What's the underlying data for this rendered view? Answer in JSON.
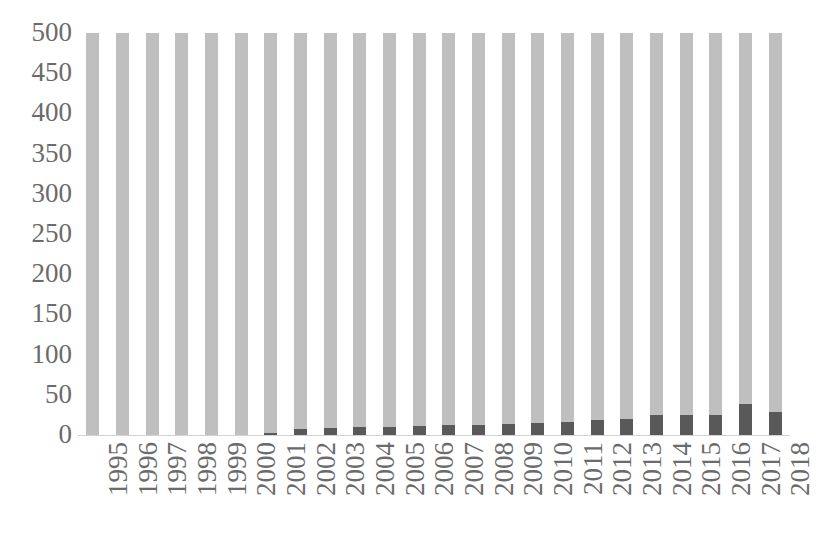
{
  "chart_data": {
    "type": "bar",
    "title": "",
    "subtitle": "",
    "xlabel": "",
    "ylabel": "",
    "ylim": [
      0,
      500
    ],
    "ytick_labels": [
      "500",
      "450",
      "400",
      "350",
      "300",
      "250",
      "200",
      "150",
      "100",
      "50",
      "0"
    ],
    "ytick_values": [
      500,
      450,
      400,
      350,
      300,
      250,
      200,
      150,
      100,
      50,
      0
    ],
    "grid": false,
    "legend": "none",
    "bar_overlap": "overlaid",
    "categories": [
      "1995",
      "1996",
      "1997",
      "1998",
      "1999",
      "2000",
      "2001",
      "2002",
      "2003",
      "2004",
      "2005",
      "2006",
      "2007",
      "2008",
      "2009",
      "2010",
      "2011",
      "2012",
      "2013",
      "2014",
      "2015",
      "2016",
      "2017",
      "2018"
    ],
    "series": [
      {
        "name": "series-1",
        "color": "#bfbfbf",
        "clipped_at_axis_max": true,
        "values": [
          500,
          500,
          500,
          500,
          500,
          500,
          500,
          500,
          500,
          500,
          500,
          500,
          500,
          500,
          500,
          500,
          500,
          500,
          500,
          500,
          500,
          500,
          500,
          500
        ]
      },
      {
        "name": "series-2",
        "color": "#595959",
        "clipped_at_axis_max": false,
        "values": [
          0,
          0,
          0,
          0,
          0,
          0,
          2,
          8,
          9,
          10,
          10,
          11,
          12,
          13,
          14,
          15,
          16,
          19,
          20,
          25,
          25,
          25,
          38,
          29
        ]
      }
    ]
  }
}
